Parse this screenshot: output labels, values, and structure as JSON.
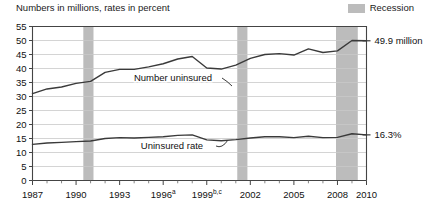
{
  "header": {
    "subtitle": "Numbers in millions, rates in percent",
    "legend_label": "Recession",
    "legend_color": "#bcbcbc"
  },
  "annotations": {
    "number_label": "Number uninsured",
    "rate_label": "Uninsured rate",
    "number_value": "49.9 million",
    "rate_value": "16.3%"
  },
  "chart_data": {
    "type": "line",
    "title": "",
    "subtitle": "Numbers in millions, rates in percent",
    "xlabel": "",
    "ylabel": "",
    "ylim": [
      0,
      55
    ],
    "ytick_values": [
      0,
      5,
      10,
      15,
      20,
      25,
      30,
      35,
      40,
      45,
      50,
      55
    ],
    "ytick_labels": [
      "0",
      "5",
      "10",
      "15",
      "20",
      "25",
      "30",
      "35",
      "40",
      "45",
      "50",
      "55"
    ],
    "grid": true,
    "xlim": [
      1987,
      2010
    ],
    "x": [
      1987,
      1988,
      1989,
      1990,
      1991,
      1992,
      1993,
      1994,
      1995,
      1996,
      1997,
      1998,
      1999,
      2000,
      2001,
      2002,
      2003,
      2004,
      2005,
      2006,
      2007,
      2008,
      2009,
      2010
    ],
    "xtick_values": [
      1987,
      1990,
      1993,
      1996,
      1999,
      2002,
      2005,
      2008,
      2010
    ],
    "xtick_labels": [
      "1987",
      "1990",
      "1993",
      "1996",
      "1999",
      "2002",
      "2005",
      "2008",
      "2010"
    ],
    "xtick_superscripts": [
      "",
      "",
      "",
      "a",
      "b,c",
      "",
      "",
      "",
      ""
    ],
    "xtick_minor": [
      1988,
      1989,
      1991,
      1992,
      1994,
      1995,
      1997,
      1998,
      2000,
      2001,
      2003,
      2004,
      2006,
      2007,
      2009
    ],
    "legend_position": "top-right",
    "line_color": "#3a3a3a",
    "series": [
      {
        "name": "Number uninsured",
        "units": "millions",
        "end_label": "49.9 million",
        "values": [
          31.0,
          32.7,
          33.4,
          34.7,
          35.4,
          38.6,
          39.7,
          39.7,
          40.6,
          41.7,
          43.4,
          44.3,
          40.2,
          39.8,
          41.2,
          43.6,
          45.0,
          45.3,
          44.8,
          47.0,
          45.7,
          46.3,
          50.0,
          49.9
        ]
      },
      {
        "name": "Uninsured rate",
        "units": "percent",
        "end_label": "16.3%",
        "values": [
          12.9,
          13.4,
          13.6,
          13.9,
          14.1,
          15.0,
          15.3,
          15.2,
          15.4,
          15.6,
          16.1,
          16.3,
          14.5,
          14.2,
          14.6,
          15.2,
          15.6,
          15.6,
          15.3,
          15.8,
          15.3,
          15.4,
          16.7,
          16.3
        ]
      }
    ],
    "recession_bands": [
      {
        "start": 1990.5,
        "end": 1991.2
      },
      {
        "start": 2001.1,
        "end": 2001.8
      },
      {
        "start": 2007.9,
        "end": 2009.4
      }
    ],
    "recession_color": "#bcbcbc"
  }
}
